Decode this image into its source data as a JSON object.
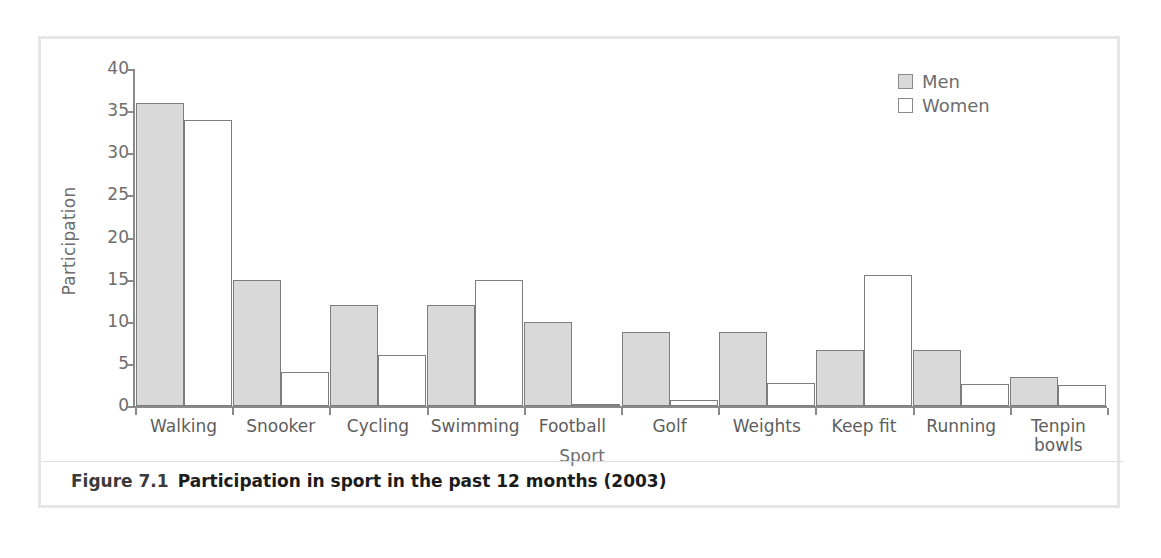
{
  "figure": {
    "caption_number": "Figure 7.1",
    "caption_text": "Participation in sport in the past 12 months (2003)"
  },
  "legend": {
    "position": "top-right",
    "entries": [
      {
        "label": "Men",
        "swatch": "men-swatch",
        "color": "#d9d9d9"
      },
      {
        "label": "Women",
        "swatch": "women-swatch",
        "color": "#ffffff"
      }
    ]
  },
  "chart_data": {
    "type": "bar",
    "title": "Participation in sport in the past 12 months (2003)",
    "xlabel": "Sport",
    "ylabel": "Participation",
    "ylim": [
      0,
      40
    ],
    "yticks": [
      0,
      5,
      10,
      15,
      20,
      25,
      30,
      35,
      40
    ],
    "grid": false,
    "legend_position": "top-right",
    "categories": [
      "Walking",
      "Snooker",
      "Cycling",
      "Swimming",
      "Football",
      "Golf",
      "Weights",
      "Keep fit",
      "Running",
      "Tenpin\nbowls"
    ],
    "series": [
      {
        "name": "Men",
        "color": "#d9d9d9",
        "values": [
          36,
          15,
          12,
          12,
          10,
          8.8,
          8.8,
          6.7,
          6.6,
          3.5
        ]
      },
      {
        "name": "Women",
        "color": "#ffffff",
        "values": [
          34,
          4,
          6,
          15,
          0.2,
          0.7,
          2.7,
          15.6,
          2.6,
          2.5
        ]
      }
    ]
  }
}
